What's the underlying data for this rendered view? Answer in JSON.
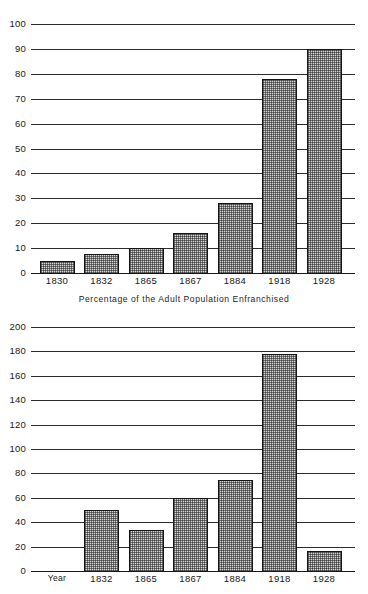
{
  "figure": {
    "caption": "Percentage of the Adult Population Enfranchised",
    "background_color": "#ffffff",
    "bar_fill_color": "#d6d6d6",
    "bar_border_color": "#151515",
    "gridline_color": "#2b2b2b"
  },
  "chart_data": [
    {
      "id": "top",
      "type": "bar",
      "title": "",
      "xlabel": "",
      "ylabel": "",
      "categories": [
        "1830",
        "1832",
        "1865",
        "1867",
        "1884",
        "1918",
        "1928"
      ],
      "values": [
        5,
        7.5,
        10,
        16,
        28,
        78,
        90
      ],
      "ylim": [
        0,
        100
      ],
      "yticks": [
        0,
        10,
        20,
        30,
        40,
        50,
        60,
        70,
        80,
        90,
        100
      ],
      "ytick_labels": [
        "0",
        "10",
        "20",
        "30",
        "40",
        "50",
        "60",
        "70",
        "80",
        "90",
        "100"
      ],
      "grid": true,
      "legend": "none"
    },
    {
      "id": "bottom",
      "type": "bar",
      "title": "",
      "xlabel": "Year",
      "ylabel": "",
      "categories": [
        "Year",
        "1832",
        "1865",
        "1867",
        "1884",
        "1918",
        "1928"
      ],
      "values": [
        null,
        50,
        34,
        60,
        75,
        178,
        16
      ],
      "ylim": [
        0,
        200
      ],
      "yticks": [
        0,
        20,
        40,
        60,
        80,
        100,
        120,
        140,
        160,
        180,
        200
      ],
      "ytick_labels": [
        "0",
        "20",
        "40",
        "60",
        "80",
        "100",
        "120",
        "140",
        "160",
        "180",
        "200"
      ],
      "grid": true,
      "legend": "none"
    }
  ]
}
